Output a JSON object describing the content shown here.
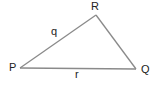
{
  "diagram": {
    "type": "triangle",
    "stroke_color": "#8a8a8a",
    "label_color": "#222222",
    "vertices": [
      {
        "name": "P",
        "x": 20,
        "y": 68
      },
      {
        "name": "R",
        "x": 96,
        "y": 15
      },
      {
        "name": "Q",
        "x": 136,
        "y": 69
      }
    ],
    "vertex_labels": {
      "P": "P",
      "R": "R",
      "Q": "Q"
    },
    "sides": [
      {
        "from": "P",
        "to": "R",
        "label": "q"
      },
      {
        "from": "R",
        "to": "Q",
        "label": ""
      },
      {
        "from": "P",
        "to": "Q",
        "label": "r"
      }
    ],
    "side_labels": {
      "q": "q",
      "r": "r"
    }
  }
}
